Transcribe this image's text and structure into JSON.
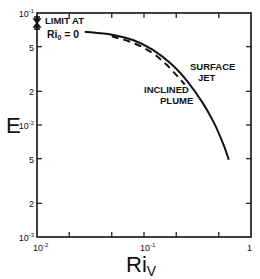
{
  "chart_data": {
    "type": "line",
    "title": "",
    "xlabel": "Ri",
    "xlabel_subscript": "V",
    "ylabel": "E",
    "xscale": "log",
    "yscale": "log",
    "xlim": [
      0.01,
      1
    ],
    "ylim": [
      0.001,
      0.1
    ],
    "grid": false,
    "x_tick_labels": [
      {
        "value": 0.01,
        "label": "10",
        "exp": "-2"
      },
      {
        "value": 0.1,
        "label": "10",
        "exp": "-1"
      },
      {
        "value": 1,
        "label": "1",
        "exp": ""
      }
    ],
    "x_minor_ticks": [
      0.02,
      0.05,
      0.2,
      0.5
    ],
    "y_tick_labels": [
      {
        "value": 0.1,
        "label": "10",
        "exp": "-1"
      },
      {
        "value": 0.05,
        "label": "5",
        "exp": ""
      },
      {
        "value": 0.02,
        "label": "2",
        "exp": ""
      },
      {
        "value": 0.01,
        "label": "10",
        "exp": "-2"
      },
      {
        "value": 0.005,
        "label": "5",
        "exp": ""
      },
      {
        "value": 0.002,
        "label": "2",
        "exp": ""
      },
      {
        "value": 0.001,
        "label": "10",
        "exp": "-3"
      }
    ],
    "series": [
      {
        "name": "SURFACE JET",
        "style": "solid",
        "x": [
          0.028,
          0.05,
          0.08,
          0.12,
          0.18,
          0.25,
          0.35,
          0.45,
          0.55,
          0.62
        ],
        "y": [
          0.068,
          0.064,
          0.057,
          0.047,
          0.035,
          0.025,
          0.016,
          0.0105,
          0.0068,
          0.0049
        ]
      },
      {
        "name": "INCLINED PLUME",
        "style": "dashed",
        "x": [
          0.05,
          0.08,
          0.12,
          0.16,
          0.2,
          0.24
        ],
        "y": [
          0.062,
          0.054,
          0.044,
          0.035,
          0.028,
          0.023
        ]
      }
    ],
    "annotations": [
      {
        "text_line1": "LIMIT AT",
        "text_line2_main": "Ri",
        "text_line2_sub": "0",
        "text_line2_rest": " = 0",
        "marker": "bracket on y-axis near E = 0.07"
      },
      {
        "text_line1": "SURFACE",
        "text_line2": "JET"
      },
      {
        "text_line1": "INCLINED",
        "text_line2": "PLUME"
      }
    ]
  }
}
